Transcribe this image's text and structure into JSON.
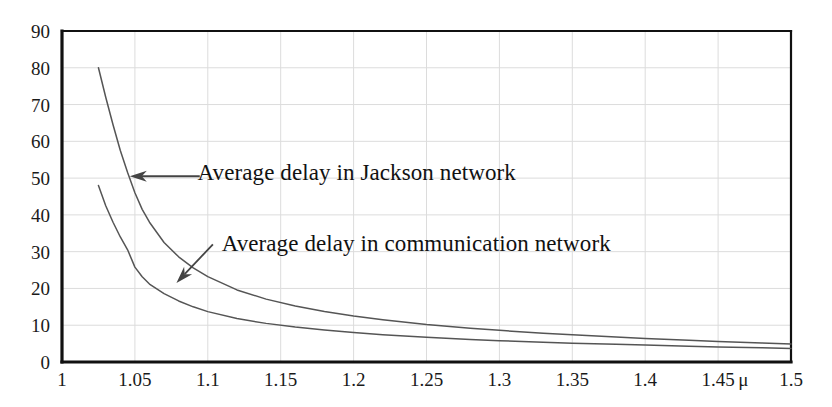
{
  "chart_data": {
    "type": "line",
    "title": "",
    "subtitle": "",
    "xlabel": "μ",
    "ylabel": "",
    "xlim": [
      1.0,
      1.5
    ],
    "ylim": [
      0,
      90
    ],
    "grid": true,
    "legend_position": "none",
    "x_ticks": [
      "1",
      "1.05",
      "1.1",
      "1.15",
      "1.2",
      "1.25",
      "1.3",
      "1.35",
      "1.4",
      "1.45",
      "1.5"
    ],
    "x_tick_values": [
      1.0,
      1.05,
      1.1,
      1.15,
      1.2,
      1.25,
      1.3,
      1.35,
      1.4,
      1.45,
      1.5
    ],
    "y_ticks": [
      "0",
      "10",
      "20",
      "30",
      "40",
      "50",
      "60",
      "70",
      "80",
      "90"
    ],
    "y_tick_values": [
      0,
      10,
      20,
      30,
      40,
      50,
      60,
      70,
      80,
      90
    ],
    "series": [
      {
        "name": "Average delay in Jackson network",
        "color": "#555555",
        "x": [
          1.025,
          1.03,
          1.035,
          1.04,
          1.045,
          1.05,
          1.055,
          1.06,
          1.07,
          1.08,
          1.09,
          1.1,
          1.12,
          1.14,
          1.16,
          1.18,
          1.2,
          1.22,
          1.25,
          1.28,
          1.3,
          1.33,
          1.35,
          1.38,
          1.4,
          1.43,
          1.45,
          1.48,
          1.5
        ],
        "y": [
          80.0,
          72.0,
          64.5,
          57.5,
          51.5,
          46.0,
          41.5,
          38.0,
          32.5,
          28.6,
          25.6,
          23.2,
          19.6,
          17.1,
          15.2,
          13.7,
          12.5,
          11.5,
          10.2,
          9.2,
          8.6,
          7.8,
          7.4,
          6.8,
          6.4,
          5.9,
          5.6,
          5.2,
          4.9
        ]
      },
      {
        "name": "Average delay in communication network",
        "color": "#555555",
        "x": [
          1.025,
          1.03,
          1.035,
          1.04,
          1.045,
          1.05,
          1.055,
          1.06,
          1.07,
          1.08,
          1.09,
          1.1,
          1.12,
          1.14,
          1.16,
          1.18,
          1.2,
          1.22,
          1.25,
          1.28,
          1.3,
          1.33,
          1.35,
          1.38,
          1.4,
          1.43,
          1.45,
          1.48,
          1.5
        ],
        "y": [
          48.0,
          42.5,
          38.0,
          34.0,
          30.5,
          25.8,
          23.2,
          21.2,
          18.6,
          16.6,
          15.0,
          13.7,
          11.8,
          10.5,
          9.5,
          8.7,
          8.0,
          7.4,
          6.7,
          6.1,
          5.8,
          5.4,
          5.1,
          4.8,
          4.6,
          4.3,
          4.1,
          3.9,
          3.7
        ]
      }
    ],
    "annotations": [
      {
        "text": "Average delay in Jackson network",
        "text_x": 1.093,
        "text_y": 51.5,
        "arrow_from_x": 1.0945,
        "arrow_from_y": 50.5,
        "arrow_to_x": 1.0465,
        "arrow_to_y": 50.5
      },
      {
        "text": "Average delay in communication network",
        "text_x": 1.1095,
        "text_y": 32.0,
        "arrow_from_x": 1.1035,
        "arrow_from_y": 32.0,
        "arrow_to_x": 1.0785,
        "arrow_to_y": 21.5
      }
    ],
    "axis_label_annotation": {
      "text": "μ",
      "x": 1.468
    },
    "colors": {
      "axis": "#111111",
      "grid": "#dcdcdc",
      "curve": "#555555",
      "text": "#1a1a1a",
      "background": "#ffffff"
    }
  }
}
